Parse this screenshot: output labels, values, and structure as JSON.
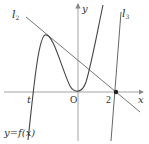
{
  "diagram": {
    "axes": {
      "x_label": "x",
      "y_label": "y",
      "origin_label": "O"
    },
    "curve": {
      "label": "y=f(x)",
      "description": "cubic with local max at x=t and local min at origin"
    },
    "tick_labels": {
      "t": "t",
      "two": "2"
    },
    "lines": [
      {
        "name": "l2",
        "label_main": "l",
        "label_sub": "2",
        "description": "tangent at local max, passes through (2,0)"
      },
      {
        "name": "l3",
        "label_main": "l",
        "label_sub": "3",
        "description": "steep line through (2,0)"
      }
    ],
    "points": [
      {
        "name": "point-2-0",
        "x": 2,
        "y": 0
      }
    ],
    "colors": {
      "stroke": "#555555",
      "axis": "#888888",
      "text": "#333333"
    }
  }
}
